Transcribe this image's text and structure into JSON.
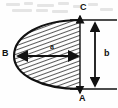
{
  "figure": {
    "background_color": "#fefefe",
    "stroke_color": "#111111",
    "hatch_color": "#222222",
    "labels": {
      "point_a": "A",
      "point_b": "B",
      "point_c": "C",
      "dim_a": "a",
      "dim_b": "b"
    },
    "annotations": [
      {
        "name": "point-A",
        "text": "A",
        "role": "bottom vertex of chord",
        "x": 79,
        "y": 94
      },
      {
        "name": "point-B",
        "text": "B",
        "role": "left apex of parabola",
        "x": 2,
        "y": 49
      },
      {
        "name": "point-C",
        "text": "C",
        "role": "top vertex of chord",
        "x": 80,
        "y": 3
      },
      {
        "name": "dimension-a",
        "text": "a",
        "role": "horizontal depth B to chord",
        "x": 50,
        "y": 43
      },
      {
        "name": "dimension-b",
        "text": "b",
        "role": "vertical chord length A to C",
        "x": 104,
        "y": 49
      }
    ],
    "geometry": {
      "parabola_apex_x": 14,
      "parabola_apex_y": 56,
      "chord_x": 80,
      "chord_top_y": 20,
      "chord_bottom_y": 89,
      "hatched": true,
      "hatch_angle_deg": 70
    },
    "arrows": {
      "horizontal": {
        "name": "a-arrow",
        "double_headed": true,
        "x1": 17,
        "x2": 79,
        "y": 56
      },
      "vertical": {
        "name": "b-arrow",
        "double_headed": true,
        "x": 95,
        "y1": 21,
        "y2": 88
      }
    },
    "extension_lines": {
      "top": {
        "x1": 70,
        "x2": 118,
        "y": 20
      },
      "bottom": {
        "x1": 70,
        "x2": 118,
        "y": 89
      }
    },
    "smudges": [
      {
        "x": 6,
        "y": 3,
        "w": 14
      },
      {
        "x": 24,
        "y": 2,
        "w": 9
      },
      {
        "x": 37,
        "y": 4,
        "w": 17
      },
      {
        "x": 58,
        "y": 2,
        "w": 11
      },
      {
        "x": 73,
        "y": 5,
        "w": 8
      },
      {
        "x": 12,
        "y": 9,
        "w": 20
      },
      {
        "x": 36,
        "y": 9,
        "w": 12
      },
      {
        "x": 52,
        "y": 10,
        "w": 16
      },
      {
        "x": 88,
        "y": 3,
        "w": 10
      },
      {
        "x": 100,
        "y": 8,
        "w": 13
      }
    ]
  }
}
